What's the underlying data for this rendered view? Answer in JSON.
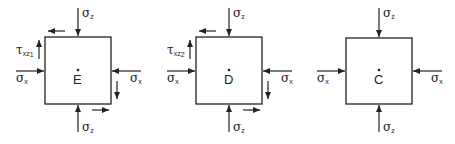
{
  "elements": [
    {
      "id": "E",
      "point_label": "E",
      "shear": true,
      "shear_label": {
        "symbol": "τ",
        "subscript": "xz",
        "sub2": "1"
      },
      "normal_x_label": {
        "symbol": "σ",
        "subscript": "x"
      },
      "normal_z_label": {
        "symbol": "σ",
        "subscript": "z"
      }
    },
    {
      "id": "D",
      "point_label": "D",
      "shear": true,
      "shear_label": {
        "symbol": "τ",
        "subscript": "xz",
        "sub2": "2"
      },
      "normal_x_label": {
        "symbol": "σ",
        "subscript": "x"
      },
      "normal_z_label": {
        "symbol": "σ",
        "subscript": "z"
      }
    },
    {
      "id": "C",
      "point_label": "C",
      "shear": false,
      "normal_x_label": {
        "symbol": "σ",
        "subscript": "x"
      },
      "normal_z_label": {
        "symbol": "σ",
        "subscript": "z"
      }
    }
  ],
  "colors": {
    "stroke": "#222222",
    "background": "#ffffff"
  }
}
